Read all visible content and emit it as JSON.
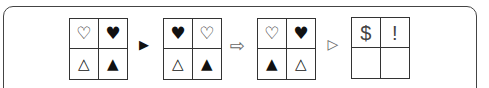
{
  "puzzle": {
    "grids": [
      {
        "cells": [
          "♡",
          "♥",
          "△",
          "▲"
        ]
      },
      {
        "cells": [
          "♥",
          "♡",
          "△",
          "▲"
        ]
      },
      {
        "cells": [
          "♡",
          "♥",
          "▲",
          "△"
        ]
      },
      {
        "cells": [
          "$",
          "!",
          "",
          ""
        ]
      }
    ],
    "arrows": [
      {
        "icon": "solid-right-triangle",
        "glyph": "▶"
      },
      {
        "icon": "hollow-right-arrow",
        "glyph": "⇨"
      },
      {
        "icon": "hollow-right-triangle",
        "glyph": "▷"
      }
    ]
  }
}
